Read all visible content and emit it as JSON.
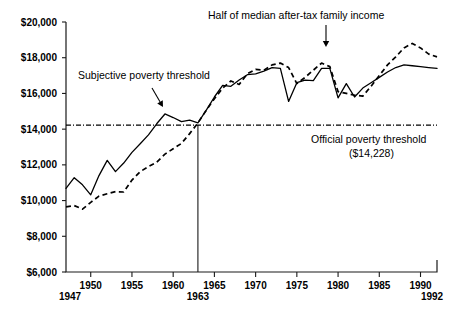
{
  "chart_data": {
    "type": "line",
    "title": "",
    "subtitle": "",
    "xlabel": "",
    "ylabel": "",
    "xlim": [
      1947,
      1992
    ],
    "ylim": [
      6000,
      20000
    ],
    "grid": false,
    "legend_position": "none",
    "y_ticks": [
      6000,
      8000,
      10000,
      12000,
      14000,
      16000,
      18000,
      20000
    ],
    "y_tick_labels": [
      "$6,000",
      "$8,000",
      "$10,000",
      "$12,000",
      "$14,000",
      "$16,000",
      "$18,000",
      "$20,000"
    ],
    "x_ticks": [
      1950,
      1955,
      1960,
      1965,
      1970,
      1975,
      1980,
      1985,
      1990
    ],
    "x_tick_labels": [
      "1950",
      "1955",
      "1960",
      "1965",
      "1970",
      "1975",
      "1980",
      "1985",
      "1990"
    ],
    "x_endpoint_labels": [
      "1947",
      "1992"
    ],
    "x_marker_label": "1963",
    "x_marker_year": 1963,
    "reference_line": {
      "label": "Official poverty threshold",
      "sublabel": "($14,228)",
      "value": 14228,
      "style": "dash-dot"
    },
    "series": [
      {
        "name": "Subjective poverty threshold",
        "style": "solid",
        "x": [
          1947,
          1948,
          1949,
          1950,
          1951,
          1952,
          1953,
          1954,
          1955,
          1956,
          1957,
          1958,
          1959,
          1960,
          1961,
          1962,
          1963,
          1964,
          1965,
          1966,
          1967,
          1968,
          1969,
          1970,
          1971,
          1972,
          1973,
          1974,
          1975,
          1976,
          1977,
          1978,
          1979,
          1980,
          1981,
          1982,
          1983,
          1984,
          1985,
          1986,
          1987,
          1988,
          1989,
          1990,
          1991,
          1992
        ],
        "values": [
          10680,
          11280,
          10880,
          10320,
          11400,
          12250,
          11620,
          12100,
          12700,
          13180,
          13680,
          14300,
          14850,
          14650,
          14420,
          14500,
          14350,
          15050,
          15800,
          16450,
          16400,
          16750,
          17050,
          17100,
          17250,
          17450,
          17400,
          15550,
          16600,
          16750,
          16720,
          17400,
          17400,
          15750,
          16550,
          15800,
          16300,
          16600,
          16900,
          17200,
          17450,
          17600,
          17550,
          17500,
          17450,
          17400
        ]
      },
      {
        "name": "Half of median after-tax family income",
        "style": "dashed",
        "x": [
          1947,
          1948,
          1949,
          1950,
          1951,
          1952,
          1953,
          1954,
          1955,
          1956,
          1957,
          1958,
          1959,
          1960,
          1961,
          1962,
          1963,
          1964,
          1965,
          1966,
          1967,
          1968,
          1969,
          1970,
          1971,
          1972,
          1973,
          1974,
          1975,
          1976,
          1977,
          1978,
          1979,
          1980,
          1981,
          1982,
          1983,
          1984,
          1985,
          1986,
          1987,
          1988,
          1989,
          1990,
          1991,
          1992
        ],
        "values": [
          9650,
          9720,
          9520,
          9900,
          10250,
          10380,
          10500,
          10480,
          11150,
          11620,
          11900,
          12150,
          12600,
          12900,
          13200,
          13750,
          14350,
          15050,
          15700,
          16300,
          16700,
          16500,
          17100,
          17350,
          17300,
          17600,
          17700,
          17450,
          16550,
          16900,
          17300,
          17700,
          17500,
          16100,
          16000,
          15900,
          15850,
          16400,
          17000,
          17600,
          18050,
          18550,
          18800,
          18550,
          18200,
          18050
        ]
      }
    ],
    "annotations": [
      {
        "name": "subjective-poverty-threshold",
        "text": "Subjective poverty threshold",
        "text_x": 78,
        "text_y": 79,
        "arrow_from": [
          152,
          88
        ],
        "arrow_to": [
          163,
          107
        ]
      },
      {
        "name": "half-median-income",
        "text": "Half of median after-tax family income",
        "text_x": 208,
        "text_y": 19,
        "arrow_from": [
          326,
          25
        ],
        "arrow_to": [
          326,
          47
        ]
      },
      {
        "name": "official-poverty-threshold",
        "text": "Official poverty threshold",
        "text_x": 311,
        "text_y": 143
      },
      {
        "name": "official-poverty-threshold-value",
        "text": "($14,228)",
        "text_x": 349,
        "text_y": 157
      }
    ]
  }
}
